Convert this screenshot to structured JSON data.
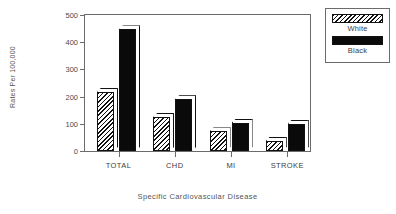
{
  "chart_data": {
    "type": "bar",
    "title": "",
    "xlabel": "Specific Cardiovascular Disease",
    "ylabel": "Rates Per 100,000",
    "categories": [
      "TOTAL",
      "CHD",
      "MI",
      "STROKE"
    ],
    "series": [
      {
        "name": "White",
        "values": [
          218,
          125,
          72,
          38
        ]
      },
      {
        "name": "Black",
        "values": [
          447,
          190,
          103,
          100
        ]
      }
    ],
    "ylim": [
      0,
      500
    ],
    "yticks": [
      0,
      100,
      200,
      300,
      400,
      500
    ],
    "ytick_labels": [
      "0",
      "100",
      "200",
      "300",
      "400",
      "500"
    ],
    "grid": false,
    "legend_position": "right-top",
    "legend_entries": [
      {
        "label": "White",
        "swatch": "hatched"
      },
      {
        "label": "Black",
        "swatch": "solid-black"
      }
    ],
    "colors": {
      "white_series": "#ffffff",
      "black_series": "#0a0a0a",
      "axis": "#6b6b6b",
      "text": "#3d3d3d"
    }
  }
}
